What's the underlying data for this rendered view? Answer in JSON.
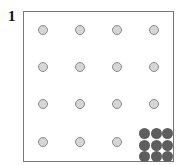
{
  "figure": {
    "label": "1",
    "grid": {
      "rows": 4,
      "cols": 4,
      "light_dot_color": "#d6d6d6",
      "light_dot_border": "#8a8a8a",
      "dots": [
        {
          "row": 0,
          "col": 0
        },
        {
          "row": 0,
          "col": 1
        },
        {
          "row": 0,
          "col": 2
        },
        {
          "row": 0,
          "col": 3
        },
        {
          "row": 1,
          "col": 0
        },
        {
          "row": 1,
          "col": 1
        },
        {
          "row": 1,
          "col": 2
        },
        {
          "row": 1,
          "col": 3
        },
        {
          "row": 2,
          "col": 0
        },
        {
          "row": 2,
          "col": 1
        },
        {
          "row": 2,
          "col": 2
        },
        {
          "row": 2,
          "col": 3
        },
        {
          "row": 3,
          "col": 0
        },
        {
          "row": 3,
          "col": 1
        },
        {
          "row": 3,
          "col": 2
        }
      ]
    },
    "cluster": {
      "position": "bottom-right",
      "rows": 3,
      "cols": 3,
      "color": "#5e5e5e"
    }
  }
}
